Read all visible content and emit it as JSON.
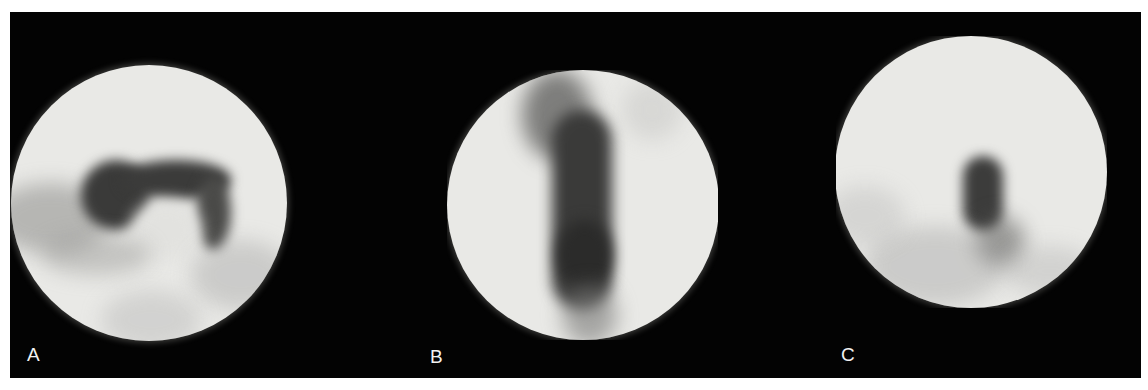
{
  "figure": {
    "background_color": "#030303",
    "page_color": "#ffffff",
    "panels": [
      {
        "label": "A",
        "description": "circular endoscopic view with dark curved (hook-shaped) opening in upper center"
      },
      {
        "label": "B",
        "description": "circular endoscopic view with dark vertical slit-like channel down the middle"
      },
      {
        "label": "C",
        "description": "circular endoscopic view with small dark oval opening right of center"
      }
    ]
  }
}
